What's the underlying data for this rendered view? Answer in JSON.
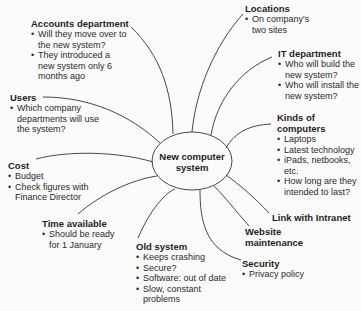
{
  "center": {
    "line1": "New computer",
    "line2": "system"
  },
  "nodes": {
    "accounts": {
      "title": "Accounts department",
      "items": [
        "Will they move over to the new system?",
        "They introduced a new system only 6 months ago"
      ]
    },
    "locations": {
      "title": "Locations",
      "items": [
        "On company's two sites"
      ]
    },
    "it": {
      "title": "IT department",
      "items": [
        "Who will build the new system?",
        "Who will install the new system?"
      ]
    },
    "users": {
      "title": "Users",
      "items": [
        "Which company departments will use the system?"
      ]
    },
    "kinds": {
      "title": "Kinds of computers",
      "items": [
        "Laptops",
        "Latest technology",
        "iPads, netbooks, etc.",
        "How long are they intended to last?"
      ]
    },
    "cost": {
      "title": "Cost",
      "items": [
        "Budget",
        "Check figures with Finance Director"
      ]
    },
    "time": {
      "title": "Time available",
      "items": [
        "Should be ready for 1 January"
      ]
    },
    "intranet": {
      "title": "Link with Intranet",
      "items": []
    },
    "website": {
      "title": "Website maintenance",
      "items": []
    },
    "old": {
      "title": "Old system",
      "items": [
        "Keeps crashing",
        "Secure?",
        "Software: out of date",
        "Slow, constant problems"
      ]
    },
    "security": {
      "title": "Security",
      "items": [
        "Privacy policy"
      ]
    }
  },
  "colors": {
    "line": "#333333",
    "text": "#1e1e1e"
  }
}
